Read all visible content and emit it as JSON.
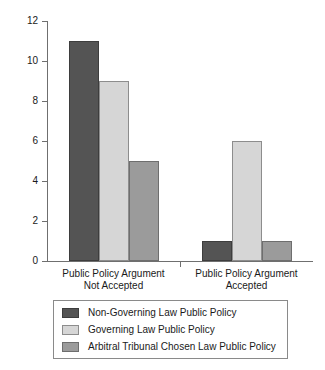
{
  "chart_data": {
    "type": "bar",
    "title": "",
    "subtitle": "",
    "xlabel": "",
    "ylabel": "",
    "categories": [
      "Public Policy Argument\nNot Accepted",
      "Public Policy Argument\nAccepted"
    ],
    "series": [
      {
        "name": "Non-Governing Law Public Policy",
        "values": [
          11,
          1
        ],
        "color": "#545454"
      },
      {
        "name": "Governing Law Public Policy",
        "values": [
          9,
          6
        ],
        "color": "#d6d6d6"
      },
      {
        "name": "Arbitral Tribunal Chosen Law Public Policy",
        "values": [
          5,
          1
        ],
        "color": "#9b9b9b"
      }
    ],
    "ylim": [
      0,
      12
    ],
    "y_ticks": [
      0,
      2,
      4,
      6,
      8,
      10,
      12
    ],
    "y_tick_labels": [
      "0",
      "2",
      "4",
      "6",
      "8",
      "10",
      "12"
    ],
    "grid": false,
    "legend_position": "bottom",
    "legend_entries": [
      "Non-Governing Law Public Policy",
      "Governing Law Public Policy",
      "Arbitral Tribunal Chosen Law Public Policy"
    ]
  }
}
